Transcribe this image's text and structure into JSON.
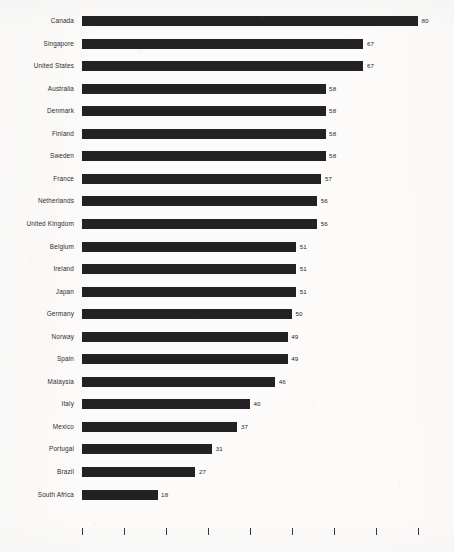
{
  "chart_data": {
    "type": "bar",
    "orientation": "horizontal",
    "title": "",
    "subtitle": "",
    "xlabel": "",
    "ylabel": "",
    "xlim": [
      0,
      80
    ],
    "grid": false,
    "legend": false,
    "legend_position": "none",
    "bar_color": "#222224",
    "background_color": "#fcfbfa",
    "text_color": "#2b2b2b",
    "value_labels_shown": true,
    "tick_labels_shown": false,
    "tick_count": 9,
    "tick_values": [
      0,
      10,
      20,
      30,
      40,
      50,
      60,
      70,
      80
    ],
    "categories": [
      "Canada",
      "Singapore",
      "United States",
      "Australia",
      "Denmark",
      "Finland",
      "Sweden",
      "France",
      "Netherlands",
      "United Kingdom",
      "Belgium",
      "Ireland",
      "Japan",
      "Germany",
      "Norway",
      "Spain",
      "Malaysia",
      "Italy",
      "Mexico",
      "Portugal",
      "Brazil",
      "South Africa"
    ],
    "values": [
      80,
      67,
      67,
      58,
      58,
      58,
      58,
      57,
      56,
      56,
      51,
      51,
      51,
      50,
      49,
      49,
      46,
      40,
      37,
      31,
      27,
      18
    ]
  }
}
